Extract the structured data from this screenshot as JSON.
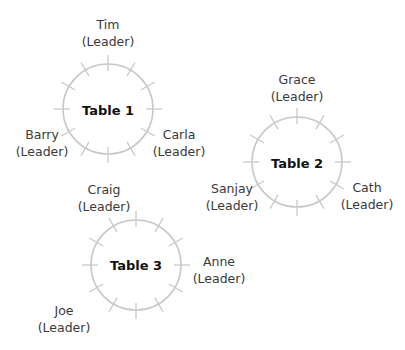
{
  "colors": {
    "ring": "#c9c9c9",
    "label_text": "#3a3a3a",
    "title_text": "#111111",
    "background": "#ffffff"
  },
  "tables": [
    {
      "title": "Table 1",
      "cx": 108,
      "cy": 109,
      "r": 45,
      "ticks": 12,
      "people": [
        {
          "name": "Tim",
          "role": "(Leader)",
          "x": 108,
          "y": 17
        },
        {
          "name": "Barry",
          "role": "(Leader)",
          "x": 42,
          "y": 127
        },
        {
          "name": "Carla",
          "role": "(Leader)",
          "x": 179,
          "y": 127
        }
      ]
    },
    {
      "title": "Table 2",
      "cx": 297,
      "cy": 162,
      "r": 45,
      "ticks": 12,
      "people": [
        {
          "name": "Grace",
          "role": "(Leader)",
          "x": 297,
          "y": 72
        },
        {
          "name": "Sanjay",
          "role": "(Leader)",
          "x": 232,
          "y": 181
        },
        {
          "name": "Cath",
          "role": "(Leader)",
          "x": 367,
          "y": 180
        }
      ]
    },
    {
      "title": "Table 3",
      "cx": 136,
      "cy": 265,
      "r": 45,
      "ticks": 12,
      "people": [
        {
          "name": "Craig",
          "role": "(Leader)",
          "x": 104,
          "y": 182
        },
        {
          "name": "Anne",
          "role": "(Leader)",
          "x": 219,
          "y": 254
        },
        {
          "name": "Joe",
          "role": "(Leader)",
          "x": 64,
          "y": 303
        }
      ]
    }
  ]
}
